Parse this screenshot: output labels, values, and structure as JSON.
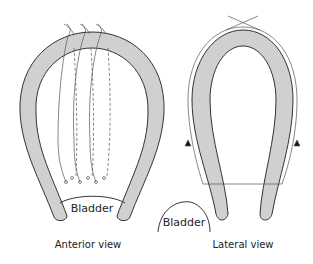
{
  "diagram": {
    "panels": [
      {
        "id": "anterior",
        "caption": "Anterior view",
        "organ_label": "Bladder"
      },
      {
        "id": "lateral",
        "caption": "Lateral view",
        "organ_label": "Bladder"
      }
    ],
    "colors": {
      "band_fill": "#d0d0d0",
      "stroke": "#333333",
      "suture": "#555555"
    }
  }
}
